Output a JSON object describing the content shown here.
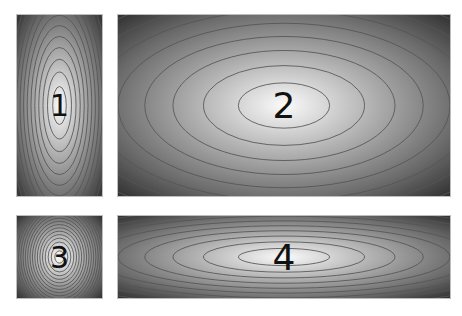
{
  "figure": {
    "background": "#ffffff",
    "panels": [
      {
        "id": "1",
        "label": "1",
        "x": 17,
        "y": 15,
        "w": 85,
        "h": 181,
        "rx_scale": 0.32,
        "ry_scale": 0.42,
        "levels": 18,
        "font_size": 30
      },
      {
        "id": "2",
        "label": "2",
        "x": 118,
        "y": 15,
        "w": 332,
        "h": 181,
        "rx_scale": 0.55,
        "ry_scale": 0.5,
        "levels": 14,
        "font_size": 36
      },
      {
        "id": "3",
        "label": "3",
        "x": 17,
        "y": 216,
        "w": 85,
        "h": 82,
        "rx_scale": 0.22,
        "ry_scale": 0.3,
        "levels": 16,
        "font_size": 30
      },
      {
        "id": "4",
        "label": "4",
        "x": 118,
        "y": 216,
        "w": 332,
        "h": 82,
        "rx_scale": 0.55,
        "ry_scale": 0.42,
        "levels": 14,
        "font_size": 36
      }
    ],
    "colors": {
      "dark": "#333333",
      "light": "#fafafa",
      "contour": "#555555"
    }
  }
}
